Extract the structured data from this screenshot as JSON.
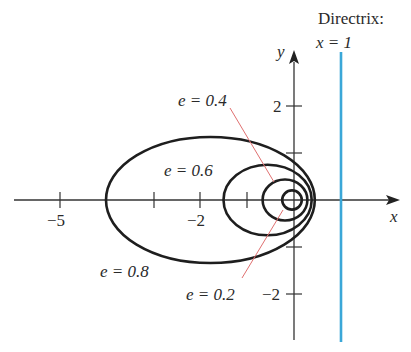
{
  "diagram": {
    "directrix": {
      "label_line1": "Directrix:",
      "label_line2": "x = 1",
      "x": 1,
      "color": "#3aa7d8"
    },
    "axes": {
      "x_label": "x",
      "y_label": "y",
      "x_ticks": [
        {
          "value": -5,
          "label": "−5"
        },
        {
          "value": -3,
          "label": ""
        },
        {
          "value": -2,
          "label": "−2"
        },
        {
          "value": -1,
          "label": ""
        },
        {
          "value": 1,
          "label": ""
        }
      ],
      "y_ticks": [
        {
          "value": 2,
          "label": "2"
        },
        {
          "value": 1,
          "label": ""
        },
        {
          "value": -1,
          "label": ""
        },
        {
          "value": -2,
          "label": "−2"
        }
      ]
    },
    "curves": [
      {
        "e": 0.2,
        "label": "e = 0.2"
      },
      {
        "e": 0.4,
        "label": "e = 0.4"
      },
      {
        "e": 0.6,
        "label": "e = 0.6"
      },
      {
        "e": 0.8,
        "label": "e = 0.8"
      }
    ],
    "leader_color": "#e07070"
  }
}
